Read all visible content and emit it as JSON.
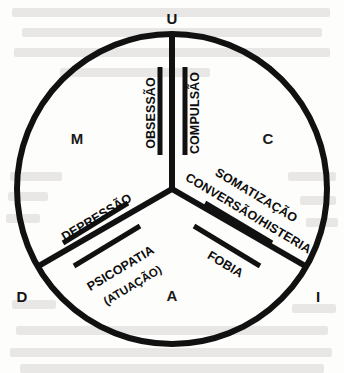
{
  "figure": {
    "type": "triadic-circle-diagram",
    "language": "pt-BR",
    "background_color": "#fdfdfc",
    "ink_color": "#111111"
  },
  "circle": {
    "center_x": 172,
    "center_y": 189,
    "radius": 155,
    "stroke_width": 6
  },
  "axes": [
    {
      "id": "u",
      "label": "U",
      "angle_deg": 90,
      "label_x": 172,
      "label_y": 20
    },
    {
      "id": "d",
      "label": "D",
      "angle_deg": 210,
      "label_x": 22,
      "label_y": 298
    },
    {
      "id": "i",
      "label": "I",
      "angle_deg": 330,
      "label_x": 318,
      "label_y": 298
    }
  ],
  "sectors": [
    {
      "id": "m",
      "label": "M",
      "label_x": 77,
      "label_y": 140
    },
    {
      "id": "c",
      "label": "C",
      "label_x": 268,
      "label_y": 140
    },
    {
      "id": "a",
      "label": "A",
      "label_x": 172,
      "label_y": 297
    }
  ],
  "spoke_labels": [
    {
      "id": "obsessao",
      "text": "OBSESSÃO",
      "side": "left-of-vertical-spoke",
      "x": 152,
      "y": 113,
      "rotate": -90,
      "size": "normal"
    },
    {
      "id": "compulsao",
      "text": "COMPULSÃO",
      "side": "right-of-vertical-spoke",
      "x": 196,
      "y": 113,
      "rotate": -90,
      "size": "normal"
    },
    {
      "id": "depressao",
      "text": "DEPRESSÃO",
      "side": "above-lower-left-spoke",
      "x": 97,
      "y": 218,
      "rotate": -31,
      "size": "normal"
    },
    {
      "id": "psicopatia",
      "text": "PSICOPATIA",
      "side": "below-lower-left-spoke",
      "x": 121,
      "y": 269,
      "rotate": -31,
      "size": "normal"
    },
    {
      "id": "psicopatia-atuacao",
      "text": "(ATUAÇÃO)",
      "side": "below-lower-left-spoke",
      "x": 133,
      "y": 286,
      "rotate": -31,
      "size": "small"
    },
    {
      "id": "somatizacao",
      "text": "SOMATIZAÇÃO",
      "side": "above-lower-right-spoke",
      "x": 256,
      "y": 196,
      "rotate": 31,
      "size": "normal"
    },
    {
      "id": "conversao-histeria",
      "text": "CONVERSÃO/HISTERIA",
      "side": "above-lower-right-spoke",
      "x": 248,
      "y": 214,
      "rotate": 31,
      "size": "normal"
    },
    {
      "id": "fobia",
      "text": "FOBIA",
      "side": "below-lower-right-spoke",
      "x": 225,
      "y": 265,
      "rotate": 31,
      "size": "normal"
    }
  ],
  "emphasis_bars": {
    "description": "Thick parallel bars flanking each spoke",
    "stroke_width": 5,
    "groups": [
      {
        "spoke": "u",
        "bars": [
          {
            "x1": 160,
            "y1": 67,
            "x2": 160,
            "y2": 155
          },
          {
            "x1": 185,
            "y1": 67,
            "x2": 185,
            "y2": 155
          }
        ]
      },
      {
        "spoke": "d",
        "bars": [
          {
            "x1": 128,
            "y1": 203,
            "x2": 63,
            "y2": 243
          },
          {
            "x1": 140,
            "y1": 226,
            "x2": 74,
            "y2": 266
          }
        ]
      },
      {
        "spoke": "i",
        "bars": [
          {
            "x1": 205,
            "y1": 203,
            "x2": 272,
            "y2": 243
          },
          {
            "x1": 194,
            "y1": 226,
            "x2": 260,
            "y2": 266
          }
        ]
      }
    ]
  },
  "ghost_text_lines": [
    {
      "x": 12,
      "y": 8,
      "w": 318
    },
    {
      "x": 22,
      "y": 28,
      "w": 300
    },
    {
      "x": 14,
      "y": 48,
      "w": 316
    },
    {
      "x": 60,
      "y": 68,
      "w": 150
    },
    {
      "x": 10,
      "y": 172,
      "w": 52
    },
    {
      "x": 288,
      "y": 172,
      "w": 48
    },
    {
      "x": 8,
      "y": 192,
      "w": 40
    },
    {
      "x": 300,
      "y": 196,
      "w": 36
    },
    {
      "x": 6,
      "y": 214,
      "w": 34
    },
    {
      "x": 306,
      "y": 218,
      "w": 32
    },
    {
      "x": 12,
      "y": 300,
      "w": 44
    },
    {
      "x": 292,
      "y": 304,
      "w": 44
    },
    {
      "x": 16,
      "y": 326,
      "w": 312
    },
    {
      "x": 10,
      "y": 348,
      "w": 322
    },
    {
      "x": 20,
      "y": 364,
      "w": 304
    }
  ]
}
